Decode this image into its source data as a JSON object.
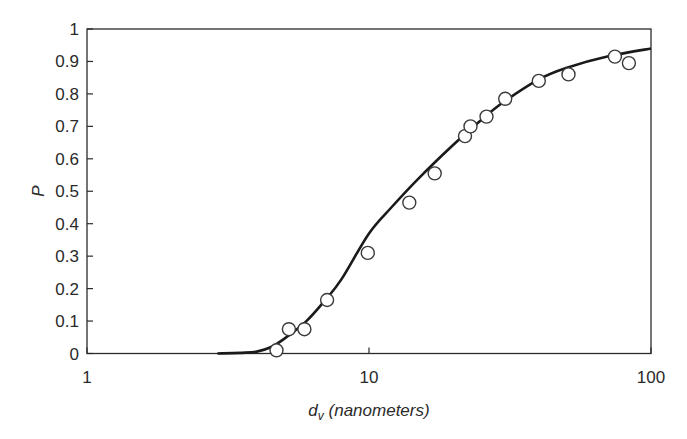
{
  "chart_data": {
    "type": "scatter",
    "title": "",
    "xlabel": "d_v (nanometers)",
    "xlabel_main": "d",
    "xlabel_sub": "v",
    "xlabel_unit": "(nanometers)",
    "ylabel": "P",
    "xscale": "log",
    "xlim": [
      1,
      100
    ],
    "ylim": [
      0,
      1
    ],
    "grid": false,
    "legend": null,
    "x_ticks": [
      1,
      10,
      100
    ],
    "x_tick_labels": [
      "1",
      "10",
      "100"
    ],
    "y_ticks": [
      0,
      0.1,
      0.2,
      0.3,
      0.4,
      0.5,
      0.6,
      0.7,
      0.8,
      0.9,
      1
    ],
    "y_tick_labels": [
      "0",
      "0.1",
      "0.2",
      "0.3",
      "0.4",
      "0.5",
      "0.6",
      "0.7",
      "0.8",
      "0.9",
      "1"
    ],
    "series": [
      {
        "name": "measured",
        "style": "open-circle",
        "x": [
          4.7,
          5.2,
          5.9,
          7.1,
          9.9,
          13.9,
          17.1,
          21.9,
          22.9,
          26.1,
          30.4,
          40,
          51,
          74.5,
          83.5
        ],
        "y": [
          0.01,
          0.075,
          0.075,
          0.165,
          0.31,
          0.465,
          0.555,
          0.67,
          0.7,
          0.73,
          0.785,
          0.84,
          0.86,
          0.915,
          0.895
        ]
      },
      {
        "name": "model",
        "style": "solid-line",
        "x": [
          2.9,
          3.5,
          4.0,
          4.5,
          5.0,
          6.0,
          7.0,
          8.0,
          10.0,
          12.0,
          15.0,
          20.0,
          25.0,
          30.0,
          40.0,
          50.0,
          70.0,
          100.0
        ],
        "y": [
          0.0,
          0.002,
          0.006,
          0.02,
          0.045,
          0.1,
          0.165,
          0.23,
          0.37,
          0.45,
          0.54,
          0.645,
          0.72,
          0.775,
          0.845,
          0.88,
          0.915,
          0.94
        ]
      }
    ]
  }
}
